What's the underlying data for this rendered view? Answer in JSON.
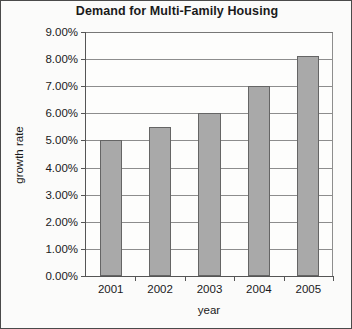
{
  "chart_data": {
    "type": "bar",
    "title": "Demand for Multi-Family Housing",
    "xlabel": "year",
    "ylabel": "growth rate",
    "categories": [
      "2001",
      "2002",
      "2003",
      "2004",
      "2005"
    ],
    "values": [
      5.0,
      5.5,
      6.0,
      7.0,
      8.1
    ],
    "value_labels": [
      "5.00%",
      "5.50%",
      "6.00%",
      "7.00%",
      "8.10%"
    ],
    "ylim": [
      0,
      9
    ],
    "ytick_values": [
      0,
      1,
      2,
      3,
      4,
      5,
      6,
      7,
      8,
      9
    ],
    "ytick_labels": [
      "0.00%",
      "1.00%",
      "2.00%",
      "3.00%",
      "4.00%",
      "5.00%",
      "6.00%",
      "7.00%",
      "8.00%",
      "9.00%"
    ],
    "grid": true,
    "legend": false,
    "bar_color": "#a9a9a9",
    "bar_border_color": "#656565",
    "axis_color": "#555555",
    "gridline_color": "#8d8d8d",
    "background_color": "#fbfbfa",
    "text_color": "#1a1a1a"
  }
}
